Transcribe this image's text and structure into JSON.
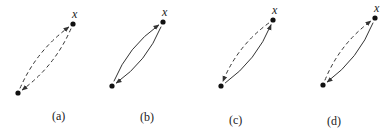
{
  "figure": {
    "panels": [
      {
        "id": "a",
        "label": "(a)",
        "point_label": "x",
        "top": [
          73,
          24
        ],
        "bottom": [
          18,
          93
        ],
        "left_arc": {
          "style": "dashed",
          "direction": "up"
        },
        "right_arc": {
          "style": "dashed",
          "direction": "down"
        },
        "label_pos": [
          52,
          120
        ]
      },
      {
        "id": "b",
        "label": "(b)",
        "point_label": "x",
        "top": [
          163,
          22
        ],
        "bottom": [
          112,
          86
        ],
        "left_arc": {
          "style": "solid",
          "direction": "up"
        },
        "right_arc": {
          "style": "solid",
          "direction": "down"
        },
        "label_pos": [
          140,
          121
        ]
      },
      {
        "id": "c",
        "label": "(c)",
        "point_label": "x",
        "top": [
          273,
          20
        ],
        "bottom": [
          221,
          86
        ],
        "left_arc": {
          "style": "dashed",
          "direction": "down"
        },
        "right_arc": {
          "style": "solid",
          "direction": "up"
        },
        "label_pos": [
          229,
          124
        ]
      },
      {
        "id": "d",
        "label": "(d)",
        "point_label": "x",
        "top": [
          375,
          18
        ],
        "bottom": [
          323,
          85
        ],
        "left_arc": {
          "style": "dashed",
          "direction": "up"
        },
        "right_arc": {
          "style": "solid",
          "direction": "down"
        },
        "label_pos": [
          327,
          125
        ]
      }
    ],
    "colors": {
      "stroke": "#333333",
      "point": "#111111",
      "background": "#ffffff"
    }
  }
}
